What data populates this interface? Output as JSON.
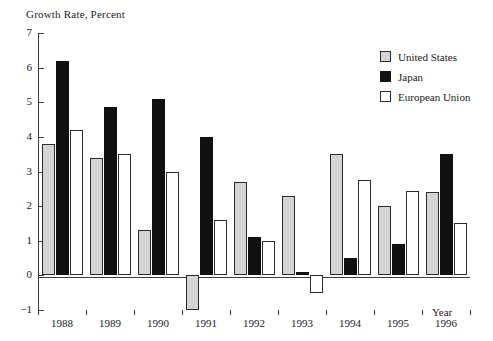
{
  "chart_data": {
    "type": "bar",
    "title": "",
    "ylabel": "Growth Rate, Percent",
    "xlabel": "Year",
    "categories": [
      "1988",
      "1989",
      "1990",
      "1991",
      "1992",
      "1993",
      "1994",
      "1995",
      "1996"
    ],
    "ylim": [
      -1,
      7
    ],
    "yticks": [
      {
        "value": 7,
        "label": "7"
      },
      {
        "value": 6,
        "label": "6"
      },
      {
        "value": 5,
        "label": "5"
      },
      {
        "value": 4,
        "label": "4"
      },
      {
        "value": 3,
        "label": "3"
      },
      {
        "value": 2,
        "label": "2"
      },
      {
        "value": 1,
        "label": "1"
      },
      {
        "value": 0,
        "label": "0"
      },
      {
        "value": -1,
        "label": "−1"
      }
    ],
    "grid": false,
    "legend_position": "top-right",
    "series": [
      {
        "name": "United States",
        "color": "#d4d4d4",
        "edge": "#2b2b2b",
        "values": [
          3.8,
          3.4,
          1.3,
          -1.0,
          2.7,
          2.3,
          3.5,
          2.0,
          2.4
        ]
      },
      {
        "name": "Japan",
        "color": "#111111",
        "edge": "#111111",
        "values": [
          6.2,
          4.85,
          5.1,
          4.0,
          1.1,
          0.1,
          0.5,
          0.9,
          3.5
        ]
      },
      {
        "name": "European Union",
        "color": "#ffffff",
        "edge": "#2b2b2b",
        "values": [
          4.2,
          3.5,
          3.0,
          1.6,
          1.0,
          -0.5,
          2.75,
          2.45,
          1.5
        ]
      }
    ]
  },
  "legend": {
    "items": [
      {
        "label": "United States",
        "key": "us"
      },
      {
        "label": "Japan",
        "key": "jp"
      },
      {
        "label": "European Union",
        "key": "eu"
      }
    ]
  }
}
